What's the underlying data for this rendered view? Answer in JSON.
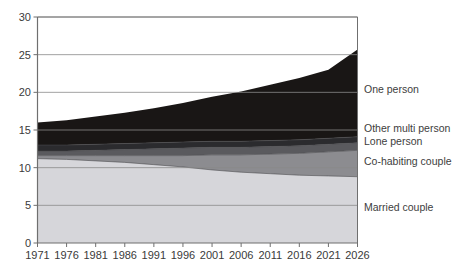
{
  "chart_data": {
    "type": "area",
    "stacked": true,
    "title": "",
    "subtitle": "",
    "xlabel": "",
    "ylabel": "",
    "xlim": [
      1971,
      2026
    ],
    "ylim": [
      0,
      30
    ],
    "ytick_step": 5,
    "grid": true,
    "legend_position": "right-inline",
    "x": [
      1971,
      1976,
      1981,
      1986,
      1991,
      1996,
      2001,
      2006,
      2011,
      2016,
      2021,
      2026
    ],
    "xtick_labels": [
      "1971",
      "1976",
      "1981",
      "1986",
      "1991",
      "1996",
      "2001",
      "2006",
      "2011",
      "2016",
      "2021",
      "2026"
    ],
    "ytick_labels": [
      "0",
      "5",
      "10",
      "15",
      "20",
      "25",
      "30"
    ],
    "ytick_values": [
      0,
      5,
      10,
      15,
      20,
      25,
      30
    ],
    "series": [
      {
        "name": "Married couple",
        "color": "#d6d6da",
        "values": [
          11.2,
          11.1,
          10.9,
          10.7,
          10.4,
          10.1,
          9.7,
          9.4,
          9.2,
          9.0,
          8.9,
          8.8
        ]
      },
      {
        "name": "Co-habiting couple",
        "color": "#8c8c90",
        "values": [
          0.4,
          0.5,
          0.7,
          0.9,
          1.2,
          1.5,
          2.0,
          2.3,
          2.6,
          2.9,
          3.2,
          3.5
        ]
      },
      {
        "name": "Lone person",
        "color": "#5a5a5e",
        "values": [
          0.6,
          0.6,
          0.7,
          0.8,
          0.9,
          1.0,
          1.0,
          1.0,
          1.0,
          1.0,
          1.0,
          1.0
        ]
      },
      {
        "name": "Other multi person",
        "color": "#2b2b2e",
        "values": [
          0.8,
          0.8,
          0.8,
          0.8,
          0.8,
          0.8,
          0.8,
          0.8,
          0.8,
          0.8,
          0.8,
          0.8
        ]
      },
      {
        "name": "One person",
        "color": "#191615",
        "values": [
          3.0,
          3.3,
          3.7,
          4.1,
          4.6,
          5.2,
          5.9,
          6.6,
          7.4,
          8.2,
          9.1,
          11.6
        ]
      }
    ],
    "cumulative_totals": [
      16.0,
      16.3,
      16.8,
      17.3,
      17.9,
      18.6,
      19.4,
      20.1,
      21.0,
      21.9,
      23.0,
      25.7
    ],
    "legend_entries": [
      {
        "label": "One person",
        "color": "#191615"
      },
      {
        "label": "Other multi person",
        "color": "#2b2b2e"
      },
      {
        "label": "Lone person",
        "color": "#5a5a5e"
      },
      {
        "label": "Co-habiting couple",
        "color": "#8c8c90"
      },
      {
        "label": "Married couple",
        "color": "#d6d6da"
      }
    ]
  },
  "axis": {
    "y_ticks": [
      "30",
      "25",
      "20",
      "15",
      "10",
      "5",
      "0"
    ],
    "x_ticks": [
      "1971",
      "1976",
      "1981",
      "1986",
      "1991",
      "1996",
      "2001",
      "2006",
      "2011",
      "2016",
      "2021",
      "2026"
    ]
  },
  "legend": {
    "one_person": "One person",
    "other_multi_person": "Other multi person",
    "lone_person": "Lone person",
    "cohabiting_couple": "Co-habiting couple",
    "married_couple": "Married couple"
  },
  "colors": {
    "axis_line": "#6f6f6f",
    "grid_line": "#8a8a8a",
    "text": "#3a3a3a",
    "background": "#ffffff"
  }
}
